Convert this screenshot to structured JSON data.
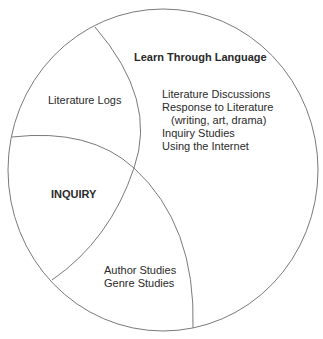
{
  "diagram": {
    "type": "circle-divided-into-regions",
    "stroke_color": "#7a7a7a",
    "regions": {
      "top_right": {
        "title": "Learn Through Language",
        "items": [
          "Literature Discussions",
          "Response to Literature",
          "(writing, art, drama)",
          "Inquiry Studies",
          "Using the Internet"
        ]
      },
      "top_left": {
        "items": [
          "Literature Logs"
        ]
      },
      "left": {
        "title": "INQUIRY"
      },
      "bottom": {
        "items": [
          "Author Studies",
          "Genre Studies"
        ]
      }
    }
  }
}
